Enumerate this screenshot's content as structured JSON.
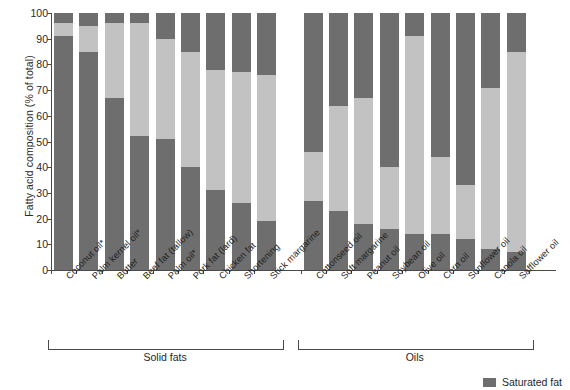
{
  "chart_data": {
    "type": "bar",
    "title": "",
    "subtitle": "",
    "xlabel": "",
    "ylabel": "Fatty acid composition (% of total)",
    "ylim": [
      0,
      100
    ],
    "yticks": [
      0,
      10,
      20,
      30,
      40,
      50,
      60,
      70,
      80,
      90,
      100
    ],
    "grid": false,
    "stacked": true,
    "legend_position": "bottom-right",
    "legend": [
      {
        "name": "Saturated fat",
        "color": "#6e6e6e"
      }
    ],
    "series": [
      {
        "name": "Saturated fat",
        "color": "#6e6e6e",
        "values": [
          91,
          85,
          67,
          52,
          51,
          40,
          31,
          26,
          19,
          27,
          23,
          18,
          16,
          14,
          14,
          12,
          8,
          7
        ]
      },
      {
        "name": "Monounsaturated fat",
        "color": "#c2c2c2",
        "values": [
          5,
          10,
          29,
          44,
          39,
          45,
          47,
          51,
          57,
          19,
          41,
          49,
          24,
          77,
          30,
          21,
          63,
          78
        ]
      },
      {
        "name": "Polyunsaturated fat",
        "color": "#6e6e6e",
        "values": [
          4,
          5,
          4,
          4,
          10,
          15,
          22,
          23,
          24,
          54,
          36,
          33,
          60,
          9,
          56,
          67,
          29,
          15
        ]
      }
    ],
    "categories": [
      "Coconut oil*",
      "Palm kernel oil*",
      "Butter",
      "Beef fat (tallow)",
      "Palm oil*",
      "Pork fat (lard)",
      "Chicken fat",
      "Shortening",
      "Stick margarine",
      "Cottonseed oil",
      "Soft margarine",
      "Peanut oil",
      "Soybean oil",
      "Olive oil",
      "Corn oil",
      "Sunflower oil",
      "Canola oil",
      "Safflower oil"
    ],
    "groups": [
      {
        "label": "Solid fats",
        "start": 0,
        "end": 8
      },
      {
        "label": "Oils",
        "start": 9,
        "end": 17
      }
    ]
  }
}
